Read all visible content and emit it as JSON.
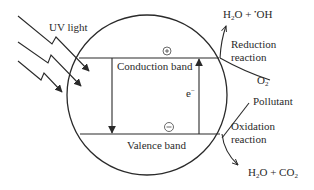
{
  "diagram": {
    "light_label": "UV light",
    "conduction_band_label": "Conduction band",
    "valence_band_label": "Valence band",
    "hole_symbol": "+",
    "electron_symbol": "−",
    "electron_label": "e",
    "electron_sup": "−",
    "reduction": {
      "label_line1": "Reduction",
      "label_line2": "reaction",
      "reactant": "O",
      "reactant_sub": "2",
      "product_a": "H",
      "product_a_sub": "2",
      "product_b": "O + ",
      "product_c_sup": "•",
      "product_c": "OH"
    },
    "oxidation": {
      "label_line1": "Oxidation",
      "label_line2": "reaction",
      "reactant": "Pollutant",
      "product_a": "H",
      "product_a_sub": "2",
      "product_b": "O + CO",
      "product_b_sub": "2"
    },
    "colors": {
      "line": "#2a2a2a",
      "background": "#ffffff"
    }
  }
}
